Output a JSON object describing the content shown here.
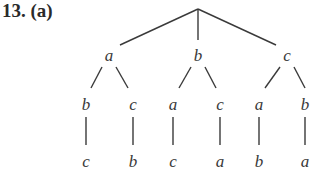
{
  "problem": {
    "number": "13.",
    "part": "(a)"
  },
  "tree": {
    "root": "",
    "level1": [
      {
        "label": "a",
        "children": [
          {
            "label": "b",
            "children": [
              {
                "label": "c"
              }
            ]
          },
          {
            "label": "c",
            "children": [
              {
                "label": "b"
              }
            ]
          }
        ]
      },
      {
        "label": "b",
        "children": [
          {
            "label": "a",
            "children": [
              {
                "label": "c"
              }
            ]
          },
          {
            "label": "c",
            "children": [
              {
                "label": "a"
              }
            ]
          }
        ]
      },
      {
        "label": "c",
        "children": [
          {
            "label": "a",
            "children": [
              {
                "label": "b"
              }
            ]
          },
          {
            "label": "b",
            "children": [
              {
                "label": "a"
              }
            ]
          }
        ]
      }
    ]
  }
}
